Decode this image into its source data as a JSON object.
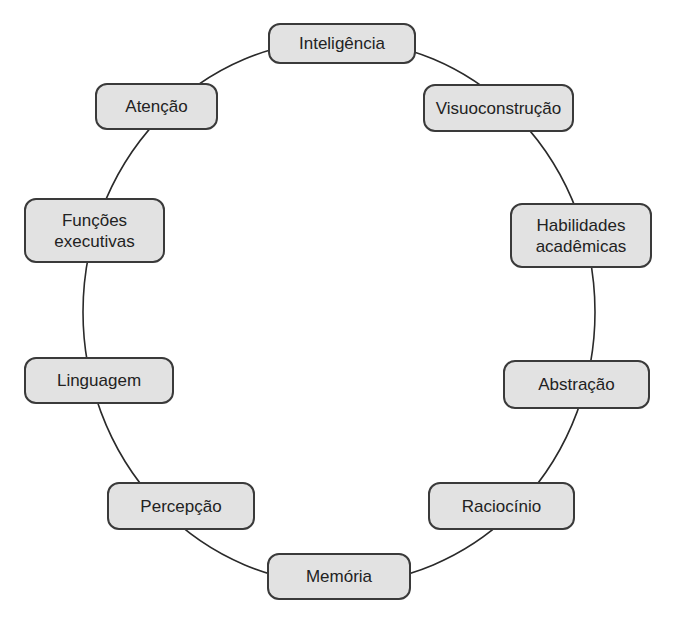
{
  "diagram": {
    "type": "circular-concept-map",
    "ring": {
      "cx": 339,
      "cy": 312,
      "rx": 256,
      "ry": 272,
      "stroke": "#2a2a2a"
    },
    "node_fill": "#e2e2e2",
    "node_border": "#3a3a3a",
    "nodes": [
      {
        "id": "inteligencia",
        "label": "Inteligência",
        "x": 268,
        "y": 23,
        "w": 148,
        "h": 41
      },
      {
        "id": "visuoconstrucao",
        "label": "Visuoconstrução",
        "x": 423,
        "y": 84,
        "w": 151,
        "h": 48
      },
      {
        "id": "habilidades-academicas",
        "label": "Habilidades\nacadêmicas",
        "x": 510,
        "y": 203,
        "w": 142,
        "h": 65
      },
      {
        "id": "abstracao",
        "label": "Abstração",
        "x": 503,
        "y": 360,
        "w": 147,
        "h": 49
      },
      {
        "id": "raciocinio",
        "label": "Raciocínio",
        "x": 428,
        "y": 482,
        "w": 147,
        "h": 48
      },
      {
        "id": "memoria",
        "label": "Memória",
        "x": 267,
        "y": 553,
        "w": 144,
        "h": 47
      },
      {
        "id": "percepcao",
        "label": "Percepção",
        "x": 107,
        "y": 482,
        "w": 148,
        "h": 48
      },
      {
        "id": "linguagem",
        "label": "Linguagem",
        "x": 24,
        "y": 357,
        "w": 150,
        "h": 47
      },
      {
        "id": "funcoes-executivas",
        "label": "Funções\nexecutivas",
        "x": 24,
        "y": 198,
        "w": 141,
        "h": 65
      },
      {
        "id": "atencao",
        "label": "Atenção",
        "x": 95,
        "y": 83,
        "w": 123,
        "h": 47
      }
    ]
  }
}
